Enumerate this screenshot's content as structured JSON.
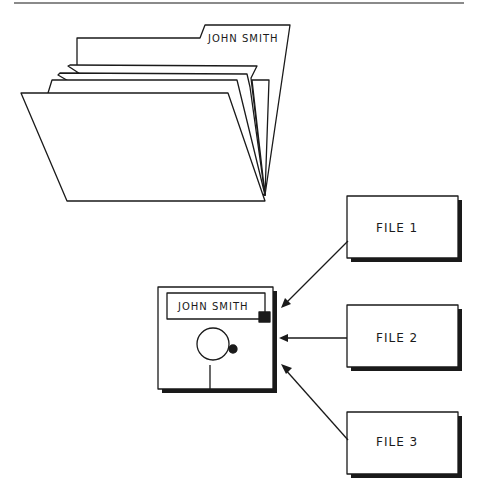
{
  "folder": {
    "tab_label": "JOHN SMITH"
  },
  "disk": {
    "label": "JOHN SMITH"
  },
  "files": [
    {
      "label": "FILE 1"
    },
    {
      "label": "FILE 2"
    },
    {
      "label": "FILE 3"
    }
  ],
  "colors": {
    "ink": "#1a1a1a",
    "paper": "#ffffff",
    "rule": "#8a8a8a"
  }
}
